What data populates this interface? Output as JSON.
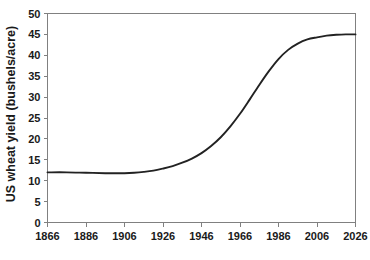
{
  "chart_data": {
    "type": "line",
    "title": "",
    "xlabel": "",
    "ylabel": "US wheat yield (bushels/acre)",
    "xlim": [
      1866,
      2026
    ],
    "ylim": [
      0,
      50
    ],
    "grid": false,
    "legend": null,
    "x_ticks": [
      1866,
      1886,
      1906,
      1926,
      1946,
      1966,
      1986,
      2006,
      2026
    ],
    "y_ticks": [
      0,
      5,
      10,
      15,
      20,
      25,
      30,
      35,
      40,
      45,
      50
    ],
    "series": [
      {
        "name": "US wheat yield",
        "color": "#222222",
        "x": [
          1866,
          1876,
          1886,
          1896,
          1901,
          1906,
          1911,
          1916,
          1921,
          1926,
          1931,
          1936,
          1941,
          1946,
          1951,
          1956,
          1961,
          1966,
          1971,
          1976,
          1981,
          1986,
          1991,
          1996,
          2001,
          2006,
          2011,
          2016,
          2021,
          2026
        ],
        "values": [
          12.0,
          12.0,
          11.9,
          11.8,
          11.8,
          11.8,
          11.9,
          12.1,
          12.4,
          12.9,
          13.5,
          14.3,
          15.3,
          16.6,
          18.3,
          20.4,
          23.0,
          26.0,
          29.4,
          32.9,
          36.2,
          39.1,
          41.3,
          42.8,
          43.8,
          44.3,
          44.7,
          44.9,
          45.0,
          45.0
        ]
      }
    ]
  },
  "axes": {
    "x_tick_labels": [
      "1866",
      "1886",
      "1906",
      "1926",
      "1946",
      "1966",
      "1986",
      "2006",
      "2026"
    ],
    "y_tick_labels": [
      "0",
      "5",
      "10",
      "15",
      "20",
      "25",
      "30",
      "35",
      "40",
      "45",
      "50"
    ],
    "y_axis_title": "US wheat yield (bushels/acre)",
    "axis_color": "#808080",
    "line_color": "#222222",
    "background_color": "#ffffff"
  }
}
